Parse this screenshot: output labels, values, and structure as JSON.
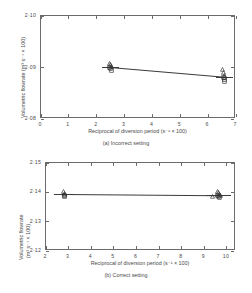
{
  "figure": {
    "panels": [
      {
        "id": "a",
        "caption": "(a) Incorrect setting",
        "xlabel": "Reciprocal of diversion period (s⁻¹ × 100)",
        "ylabel": "Volumetric flowrate (m³ s⁻¹ × 100)",
        "xticks": [
          "0",
          "1",
          "2",
          "3",
          "4",
          "5",
          "6",
          "7"
        ],
        "yticks": [
          "2·10",
          "2·09",
          "2·08"
        ]
      },
      {
        "id": "b",
        "caption": "(b) Correct setting",
        "xlabel": "Reciprocal of diversion period (s⁻¹ × 100)",
        "ylabel_line1": "Volumetric flowrate",
        "ylabel_line2": "(m³ s⁻¹ × 100)",
        "xticks": [
          "2",
          "3",
          "4",
          "5",
          "6",
          "7",
          "8",
          "9",
          "10"
        ],
        "yticks": [
          "2·15",
          "2·14",
          "2·13",
          "2·12"
        ]
      }
    ],
    "line_color": "#3b3b3b",
    "axis_color": "#6b6b6b"
  },
  "chart_data": [
    {
      "type": "scatter",
      "id": "a",
      "title": "(a) Incorrect setting",
      "xlabel": "Reciprocal of diversion period (s^-1 x 100)",
      "ylabel": "Volumetric flowrate (m^3 s^-1 x 100)",
      "xlim": [
        0,
        7
      ],
      "ylim": [
        2.08,
        2.1
      ],
      "xticks": [
        0,
        1,
        2,
        3,
        4,
        5,
        6,
        7
      ],
      "yticks": [
        2.1,
        2.09,
        2.08
      ],
      "grid": false,
      "legend": null,
      "series": [
        {
          "name": "triangle",
          "marker": "triangle-up",
          "points": [
            {
              "x": 2.48,
              "y": 2.0906
            },
            {
              "x": 2.52,
              "y": 2.0903
            },
            {
              "x": 2.55,
              "y": 2.09
            },
            {
              "x": 6.56,
              "y": 2.0894
            },
            {
              "x": 6.6,
              "y": 2.0888
            },
            {
              "x": 6.62,
              "y": 2.0883
            },
            {
              "x": 6.64,
              "y": 2.0879
            }
          ]
        },
        {
          "name": "square",
          "marker": "square",
          "points": [
            {
              "x": 2.5,
              "y": 2.0899
            },
            {
              "x": 2.53,
              "y": 2.0896
            },
            {
              "x": 2.55,
              "y": 2.0893
            },
            {
              "x": 6.58,
              "y": 2.0878
            },
            {
              "x": 6.62,
              "y": 2.0874
            },
            {
              "x": 6.64,
              "y": 2.0871
            }
          ]
        }
      ],
      "fit_line": {
        "x1": 2.52,
        "y1": 2.0899,
        "x2": 6.62,
        "y2": 2.088
      },
      "error_bars": [
        {
          "x": 2.52,
          "y": 2.09,
          "half_width": 0.3
        },
        {
          "x": 6.62,
          "y": 2.088,
          "half_width": 0.3
        }
      ]
    },
    {
      "type": "scatter",
      "id": "b",
      "title": "(b) Correct setting",
      "xlabel": "Reciprocal of diversion period (s^-1 x 100)",
      "ylabel": "Volumetric flowrate (m^3 s^-1 x 100)",
      "xlim": [
        2,
        10.4
      ],
      "ylim": [
        2.12,
        2.15
      ],
      "xticks": [
        2,
        3,
        4,
        5,
        6,
        7,
        8,
        9,
        10
      ],
      "yticks": [
        2.15,
        2.14,
        2.13,
        2.12
      ],
      "grid": false,
      "legend": null,
      "series": [
        {
          "name": "triangle",
          "marker": "triangle-up",
          "points": [
            {
              "x": 2.82,
              "y": 2.1398
            },
            {
              "x": 2.86,
              "y": 2.1394
            },
            {
              "x": 2.88,
              "y": 2.139
            },
            {
              "x": 9.4,
              "y": 2.1381
            },
            {
              "x": 9.62,
              "y": 2.14
            },
            {
              "x": 9.66,
              "y": 2.1395
            },
            {
              "x": 9.7,
              "y": 2.139
            },
            {
              "x": 9.74,
              "y": 2.1386
            }
          ]
        },
        {
          "name": "square",
          "marker": "square",
          "points": [
            {
              "x": 2.84,
              "y": 2.1387
            },
            {
              "x": 2.88,
              "y": 2.1384
            },
            {
              "x": 9.64,
              "y": 2.1385
            },
            {
              "x": 9.68,
              "y": 2.1382
            },
            {
              "x": 9.72,
              "y": 2.1379
            }
          ]
        }
      ],
      "fit_line": {
        "x1": 2.84,
        "y1": 2.1392,
        "x2": 9.68,
        "y2": 2.1388
      },
      "error_bars": [
        {
          "x": 2.84,
          "y": 2.1392,
          "half_width": 0.45
        },
        {
          "x": 9.68,
          "y": 2.1388,
          "half_width": 0.55
        }
      ]
    }
  ]
}
